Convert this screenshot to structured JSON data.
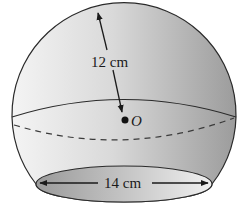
{
  "figure": {
    "type": "truncated sphere (sphere with bottom cap removed)",
    "radius_label": "12 cm",
    "opening_label": "14 cm",
    "center_label": "O"
  },
  "colors": {
    "outline": "#2a2a2a",
    "shade_light": "#f2f2f2",
    "shade_dark": "#9a9a9a",
    "opening_light": "#d8d8d8",
    "opening_dark": "#8c8c8c"
  }
}
